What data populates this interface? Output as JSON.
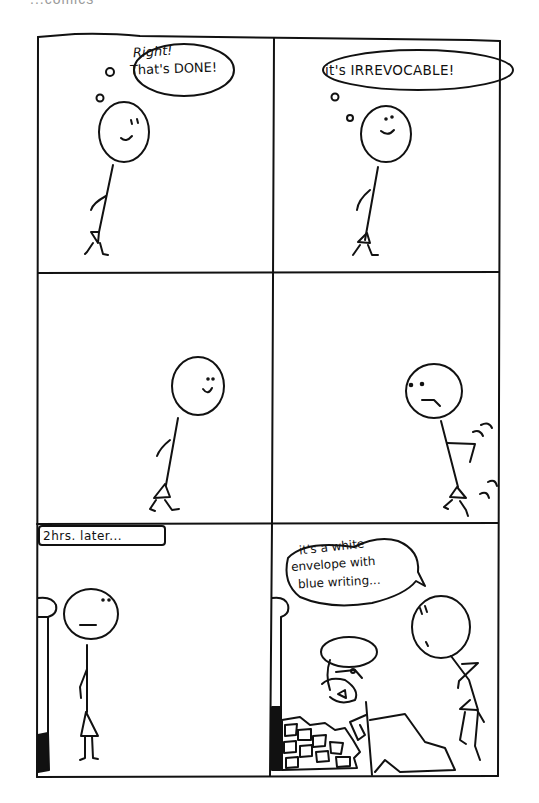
{
  "caption_partial": "...comics",
  "panels": [
    {
      "id": 1,
      "bubble_type": "thought",
      "lines": [
        "Right!",
        "That's DONE!"
      ],
      "expression": "smile"
    },
    {
      "id": 2,
      "bubble_type": "thought",
      "lines": [
        "it's IRREVOCABLE!"
      ],
      "expression": "smile"
    },
    {
      "id": 3,
      "bubble_type": "none",
      "lines": [],
      "expression": "smile"
    },
    {
      "id": 4,
      "bubble_type": "none",
      "lines": [],
      "expression": "frown"
    },
    {
      "id": 5,
      "bubble_type": "caption",
      "lines": [
        "2hrs. later..."
      ],
      "expression": "neutral"
    },
    {
      "id": 6,
      "bubble_type": "speech",
      "lines": [
        "it's a white",
        "envelope with",
        "blue writing..."
      ],
      "expression": "surprised"
    }
  ],
  "colors": {
    "ink": "#111111",
    "paper": "#ffffff"
  }
}
